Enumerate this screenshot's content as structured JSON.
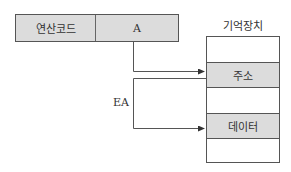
{
  "instruction": {
    "opcode_label": "연산코드",
    "address_label": "A"
  },
  "memory": {
    "title": "기억장치",
    "rows": [
      {
        "label": "",
        "shaded": false
      },
      {
        "label": "주소",
        "shaded": true
      },
      {
        "label": "",
        "shaded": false
      },
      {
        "label": "데이터",
        "shaded": true
      },
      {
        "label": "",
        "shaded": false
      }
    ]
  },
  "labels": {
    "effective_address": "EA"
  },
  "colors": {
    "shaded_fill": "#dcdcdc",
    "line": "#555555"
  }
}
